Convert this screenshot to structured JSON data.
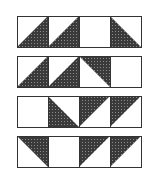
{
  "diagram": {
    "colors": {
      "dark": "#3a3a3a",
      "light": "#ffffff",
      "stroke": "#333333",
      "dot": "#8a8a8a"
    },
    "layout": {
      "x0": 17,
      "cell": 31,
      "rows_y": [
        16,
        56,
        96,
        136
      ]
    },
    "rows": [
      {
        "cells": [
          "dark-bottom-right",
          "dark-bottom-right",
          "blank",
          "dark-bottom-left"
        ]
      },
      {
        "cells": [
          "dark-bottom-right",
          "dark-bottom-right",
          "dark-top-right",
          "blank"
        ]
      },
      {
        "cells": [
          "blank",
          "dark-bottom-left",
          "dark-top-left",
          "dark-top-left"
        ]
      },
      {
        "cells": [
          "dark-top-right",
          "blank",
          "dark-top-left",
          "dark-top-left"
        ]
      }
    ]
  }
}
